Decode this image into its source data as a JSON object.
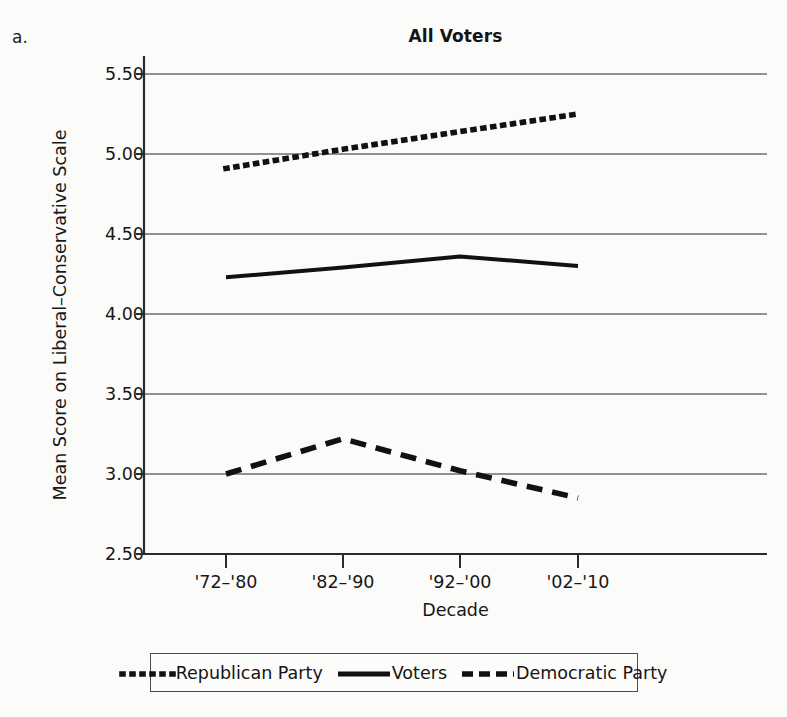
{
  "panel_letter": "a.",
  "chart_data": {
    "type": "line",
    "title": "All Voters",
    "xlabel": "Decade",
    "ylabel": "Mean Score on Liberal–Conservative Scale",
    "categories": [
      "'72–'80",
      "'82–'90",
      "'92–'00",
      "'02–'10"
    ],
    "ylim": [
      2.5,
      5.5
    ],
    "yticks": [
      "5.50",
      "5.00",
      "4.50",
      "4.00",
      "3.50",
      "3.00",
      "2.50"
    ],
    "ytick_values": [
      5.5,
      5.0,
      4.5,
      4.0,
      3.5,
      3.0,
      2.5
    ],
    "grid": true,
    "legend_position": "bottom",
    "series": [
      {
        "name": "Republican Party",
        "style": "dotted",
        "color": "#111111",
        "values": [
          4.91,
          5.03,
          5.14,
          5.25
        ]
      },
      {
        "name": "Voters",
        "style": "solid",
        "color": "#111111",
        "values": [
          4.23,
          4.29,
          4.36,
          4.3
        ]
      },
      {
        "name": "Democratic Party",
        "style": "dashed",
        "color": "#111111",
        "values": [
          3.0,
          3.22,
          3.02,
          2.85
        ]
      }
    ]
  },
  "legend": {
    "items": [
      {
        "label": "Republican Party",
        "style": "dotted"
      },
      {
        "label": "Voters",
        "style": "solid"
      },
      {
        "label": "Democratic Party",
        "style": "dashed"
      }
    ]
  }
}
